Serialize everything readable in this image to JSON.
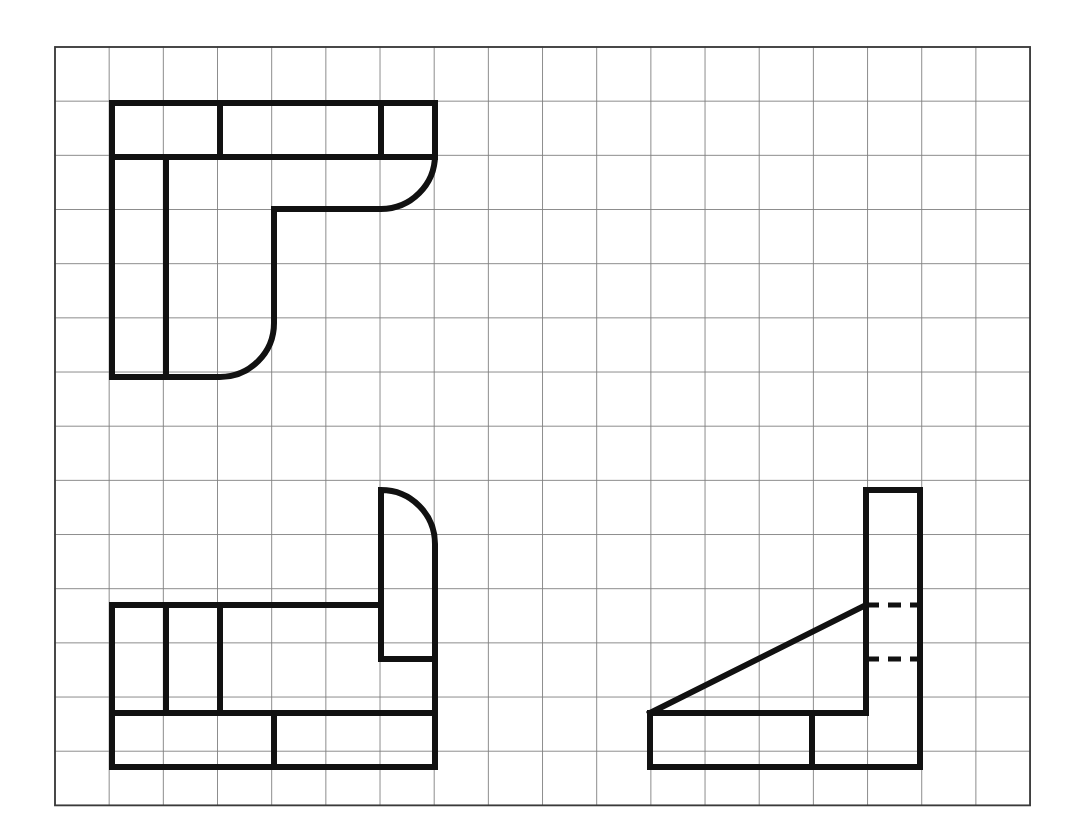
{
  "canvas": {
    "width": 1078,
    "height": 840,
    "background": "#ffffff",
    "title": "Orthographic Projection Worksheet"
  },
  "grid": {
    "origin_x": 55,
    "origin_y": 47,
    "cell": 54.17,
    "cols": 18,
    "rows": 14,
    "line_color": "#808080",
    "line_width": 0.9,
    "border_color": "#3a3a3a",
    "border_width": 1.8
  },
  "style": {
    "object_line_color": "#111111",
    "object_line_width": 6,
    "hidden_line_color": "#111111",
    "hidden_line_width": 5,
    "hidden_dash": "13 9"
  },
  "chart_data": {
    "type": "diagram",
    "subtitle": "Three part outlines drawn on a 18 x 14 isometric-style square grid",
    "grid": {
      "cols": 18,
      "rows": 14,
      "cell_px": 54.17,
      "origin": [
        55,
        47
      ]
    },
    "shapes": [
      {
        "name": "top-left-part",
        "label": "J-shaped bracket with two fillets",
        "bounds_cells": {
          "x": 1,
          "y": 1,
          "w": 6,
          "h": 5
        },
        "bounds_px": {
          "x": 112,
          "y": 103,
          "w": 323,
          "h": 274
        },
        "outline_path": "M 112 103 L 435 103 L 435 155 A 54 54 0 0 1 381 209 L 274 209 L 274 323 A 54 54 0 0 1 220 377 L 112 377 Z",
        "interior_lines": [
          {
            "type": "solid",
            "from": [
              112,
              157
            ],
            "to": [
              435,
              157
            ],
            "note": "horizontal edge row 2"
          },
          {
            "type": "solid",
            "from": [
              220,
              103
            ],
            "to": [
              220,
              157
            ],
            "note": "vertical edge col 3 upper"
          },
          {
            "type": "solid",
            "from": [
              381,
              103
            ],
            "to": [
              381,
              157
            ],
            "note": "vertical edge col 6 upper"
          },
          {
            "type": "solid",
            "from": [
              166,
              157
            ],
            "to": [
              166,
              377
            ],
            "note": "vertical edge col 2 lower"
          }
        ],
        "fillets": [
          {
            "center": [
              381,
              155
            ],
            "radius": 54,
            "corner": "top-right"
          },
          {
            "center": [
              220,
              323
            ],
            "radius": 54,
            "corner": "bottom-right-inner"
          }
        ]
      },
      {
        "name": "bottom-left-part",
        "label": "L-shaped part with upper fillet",
        "bounds_cells": {
          "x": 1,
          "y": 8.2,
          "w": 6,
          "h": 5.1
        },
        "bounds_px": {
          "x": 112,
          "y": 490,
          "w": 323,
          "h": 277
        },
        "outline_path": "M 112 605 L 381 605 L 381 490 A 54 54 0 0 1 435 544 L 435 767 L 112 767 Z",
        "interior_lines": [
          {
            "type": "solid",
            "from": [
              166,
              605
            ],
            "to": [
              166,
              713
            ],
            "note": "vertical edge col 2"
          },
          {
            "type": "solid",
            "from": [
              112,
              713
            ],
            "to": [
              435,
              713
            ],
            "note": "horizontal edge row 12.3"
          },
          {
            "type": "solid",
            "from": [
              220,
              605
            ],
            "to": [
              220,
              713
            ],
            "note": "vertical edge col 3"
          },
          {
            "type": "solid",
            "from": [
              274,
              713
            ],
            "to": [
              274,
              767
            ],
            "note": "vertical edge col 4 lower"
          },
          {
            "type": "solid",
            "from": [
              381,
              605
            ],
            "to": [
              381,
              659
            ],
            "note": "step riser"
          },
          {
            "type": "solid",
            "from": [
              381,
              659
            ],
            "to": [
              435,
              659
            ],
            "note": "step tread"
          }
        ],
        "fillets": [
          {
            "center": [
              381,
              544
            ],
            "radius": 54,
            "corner": "top-right"
          }
        ]
      },
      {
        "name": "bottom-right-part",
        "label": "Triangular gusset with vertical column and hidden lines",
        "bounds_cells": {
          "x": 11,
          "y": 8.2,
          "w": 5,
          "h": 5.1
        },
        "bounds_px": {
          "x": 650,
          "y": 490,
          "w": 270,
          "h": 277
        },
        "outline_path": "M 866 490 L 920 490 L 920 767 L 650 767 L 650 713 L 866 713 Z",
        "interior_lines": [
          {
            "type": "solid",
            "from": [
              650,
              713
            ],
            "to": [
              866,
              605
            ],
            "note": "hypotenuse of gusset"
          },
          {
            "type": "solid",
            "from": [
              866,
              490
            ],
            "to": [
              866,
              713
            ],
            "note": "column left face"
          },
          {
            "type": "solid",
            "from": [
              812,
              713
            ],
            "to": [
              812,
              767
            ],
            "note": "vertical edge col 14 lower"
          },
          {
            "type": "hidden",
            "from": [
              866,
              605
            ],
            "to": [
              920,
              605
            ],
            "note": "hidden edge row 10.3"
          },
          {
            "type": "hidden",
            "from": [
              866,
              659
            ],
            "to": [
              920,
              659
            ],
            "note": "hidden edge row 11.3"
          }
        ],
        "fillets": []
      }
    ],
    "legend": [
      {
        "key": "solid",
        "label": "Visible object line",
        "color": "#111111"
      },
      {
        "key": "hidden",
        "label": "Hidden line (dashed)",
        "color": "#111111"
      },
      {
        "key": "grid",
        "label": "Background construction grid",
        "color": "#808080"
      }
    ]
  }
}
